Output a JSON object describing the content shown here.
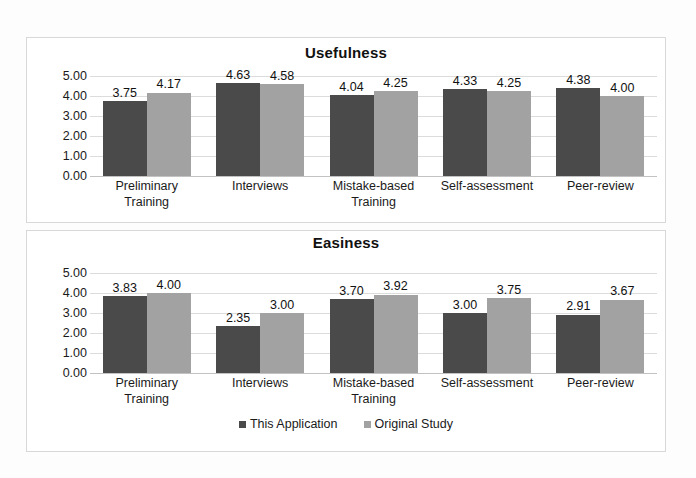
{
  "chart_data": [
    {
      "type": "bar",
      "title": "Usefulness",
      "xlabel": "",
      "ylabel": "",
      "ylim": [
        0,
        5
      ],
      "yticks": [
        "0.00",
        "1.00",
        "2.00",
        "3.00",
        "4.00",
        "5.00"
      ],
      "grid": true,
      "legend_position": "none",
      "categories": [
        "Preliminary Training",
        "Interviews",
        "Mistake-based Training",
        "Self-assessment",
        "Peer-review"
      ],
      "series": [
        {
          "name": "This Application",
          "color": "#4a4a4a",
          "values": [
            3.75,
            4.63,
            4.04,
            4.33,
            4.38
          ],
          "labels": [
            "3.75",
            "4.63",
            "4.04",
            "4.33",
            "4.38"
          ]
        },
        {
          "name": "Original Study",
          "color": "#a2a2a2",
          "values": [
            4.17,
            4.58,
            4.25,
            4.25,
            4.0
          ],
          "labels": [
            "4.17",
            "4.58",
            "4.25",
            "4.25",
            "4.00"
          ]
        }
      ]
    },
    {
      "type": "bar",
      "title": "Easiness",
      "xlabel": "",
      "ylabel": "",
      "ylim": [
        0,
        5
      ],
      "yticks": [
        "0.00",
        "1.00",
        "2.00",
        "3.00",
        "4.00",
        "5.00"
      ],
      "grid": true,
      "legend_position": "bottom-center",
      "categories": [
        "Preliminary Training",
        "Interviews",
        "Mistake-based Training",
        "Self-assessment",
        "Peer-review"
      ],
      "series": [
        {
          "name": "This Application",
          "color": "#4a4a4a",
          "values": [
            3.83,
            2.35,
            3.7,
            3.0,
            2.91
          ],
          "labels": [
            "3.83",
            "2.35",
            "3.70",
            "3.00",
            "2.91"
          ]
        },
        {
          "name": "Original Study",
          "color": "#a2a2a2",
          "values": [
            4.0,
            3.0,
            3.92,
            3.75,
            3.67
          ],
          "labels": [
            "4.00",
            "3.00",
            "3.92",
            "3.75",
            "3.67"
          ]
        }
      ]
    }
  ],
  "legend": {
    "items": [
      {
        "label": "This Application",
        "color": "#4a4a4a"
      },
      {
        "label": "Original Study",
        "color": "#a2a2a2"
      }
    ]
  }
}
